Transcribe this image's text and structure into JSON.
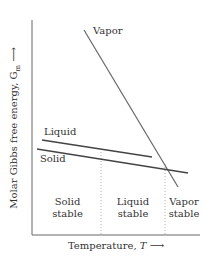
{
  "diagram": {
    "y_axis_label": "Molar Gibbs free energy, G",
    "y_axis_subscript": "m",
    "y_axis_arrow": "⟶",
    "x_axis_label": "Temperature, ",
    "x_axis_variable": "T",
    "x_axis_arrow": "⟶",
    "curves": [
      {
        "name": "Vapor",
        "label": "Vapor",
        "x1": 84,
        "y1": 30,
        "x2": 178,
        "y2": 187
      },
      {
        "name": "Liquid",
        "label": "Liquid",
        "x1": 42,
        "y1": 140,
        "x2": 152,
        "y2": 157
      },
      {
        "name": "Solid",
        "label": "Solid",
        "x1": 37,
        "y1": 149,
        "x2": 188,
        "y2": 173
      }
    ],
    "regions": [
      {
        "line1": "Solid",
        "line2": "stable"
      },
      {
        "line1": "Liquid",
        "line2": "stable"
      },
      {
        "line1": "Vapor",
        "line2": "stable"
      }
    ],
    "colors": {
      "line": "#555555",
      "axis": "#666666",
      "dotted": "#999999"
    }
  }
}
